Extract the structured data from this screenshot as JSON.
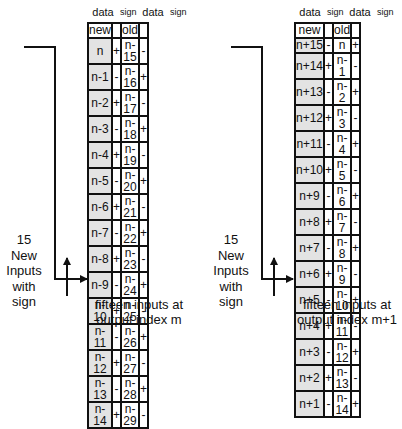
{
  "column_headers": [
    "data",
    "sign",
    "data",
    "sign"
  ],
  "panels": [
    {
      "id": "left",
      "header_row": {
        "new": "new",
        "old": "old"
      },
      "rows": [
        {
          "new": "n",
          "new_sign": "+",
          "old": "n-15",
          "old_sign": "-"
        },
        {
          "new": "n-1",
          "new_sign": "-",
          "old": "n-16",
          "old_sign": "+"
        },
        {
          "new": "n-2",
          "new_sign": "+",
          "old": "n-17",
          "old_sign": "-"
        },
        {
          "new": "n-3",
          "new_sign": "-",
          "old": "n-18",
          "old_sign": "+"
        },
        {
          "new": "n-4",
          "new_sign": "+",
          "old": "n-19",
          "old_sign": "-"
        },
        {
          "new": "n-5",
          "new_sign": "-",
          "old": "n-20",
          "old_sign": "+"
        },
        {
          "new": "n-6",
          "new_sign": "+",
          "old": "n-21",
          "old_sign": "-"
        },
        {
          "new": "n-7",
          "new_sign": "-",
          "old": "n-22",
          "old_sign": "+"
        },
        {
          "new": "n-8",
          "new_sign": "+",
          "old": "n-23",
          "old_sign": "-"
        },
        {
          "new": "n-9",
          "new_sign": "-",
          "old": "n-24",
          "old_sign": "+"
        },
        {
          "new": "n-10",
          "new_sign": "+",
          "old": "n-25",
          "old_sign": "-"
        },
        {
          "new": "n-11",
          "new_sign": "-",
          "old": "n-26",
          "old_sign": "+"
        },
        {
          "new": "n-12",
          "new_sign": "+",
          "old": "n-27",
          "old_sign": "-"
        },
        {
          "new": "n-13",
          "new_sign": "-",
          "old": "n-28",
          "old_sign": "+"
        },
        {
          "new": "n-14",
          "new_sign": "+",
          "old": "n-29",
          "old_sign": "-"
        }
      ],
      "side_label": [
        "15",
        "New",
        "Inputs",
        "with",
        "sign"
      ],
      "caption": [
        "fifteen inputs at",
        "output index m"
      ]
    },
    {
      "id": "right",
      "header_row": {
        "new": "new",
        "old": "old"
      },
      "rows": [
        {
          "new": "n+15",
          "new_sign": "-",
          "old": "n",
          "old_sign": "+"
        },
        {
          "new": "n+14",
          "new_sign": "+",
          "old": "n-1",
          "old_sign": "-"
        },
        {
          "new": "n+13",
          "new_sign": "-",
          "old": "n-2",
          "old_sign": "+"
        },
        {
          "new": "n+12",
          "new_sign": "+",
          "old": "n-3",
          "old_sign": "-"
        },
        {
          "new": "n+11",
          "new_sign": "-",
          "old": "n-4",
          "old_sign": "+"
        },
        {
          "new": "n+10",
          "new_sign": "+",
          "old": "n-5",
          "old_sign": "-"
        },
        {
          "new": "n+9",
          "new_sign": "-",
          "old": "n-6",
          "old_sign": "+"
        },
        {
          "new": "n+8",
          "new_sign": "+",
          "old": "n-7",
          "old_sign": "-"
        },
        {
          "new": "n+7",
          "new_sign": "-",
          "old": "n-8",
          "old_sign": "+"
        },
        {
          "new": "n+6",
          "new_sign": "+",
          "old": "n-9",
          "old_sign": "-"
        },
        {
          "new": "n+5",
          "new_sign": "-",
          "old": "n-10",
          "old_sign": "+"
        },
        {
          "new": "n+4",
          "new_sign": "+",
          "old": "n-11",
          "old_sign": "-"
        },
        {
          "new": "n+3",
          "new_sign": "-",
          "old": "n-12",
          "old_sign": "+"
        },
        {
          "new": "n+2",
          "new_sign": "+",
          "old": "n-13",
          "old_sign": "-"
        },
        {
          "new": "n+1",
          "new_sign": "-",
          "old": "n-14",
          "old_sign": "+"
        }
      ],
      "side_label": [
        "15",
        "New",
        "Inputs",
        "with",
        "sign"
      ],
      "caption": [
        "fifteen inputs at",
        "output index m+1"
      ]
    }
  ]
}
